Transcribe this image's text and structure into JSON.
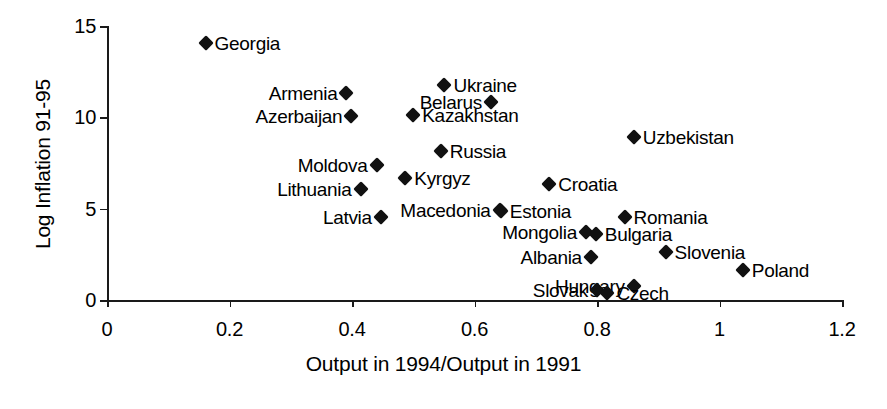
{
  "chart_data": {
    "type": "scatter",
    "title": "",
    "xlabel": "Output in 1994/Output in 1991",
    "ylabel": "Log Inflation 91-95",
    "xlim": [
      0,
      1.2
    ],
    "ylim": [
      0,
      15
    ],
    "xticks": [
      "0",
      "0.2",
      "0.4",
      "0.6",
      "0.8",
      "1",
      "1.2"
    ],
    "xtick_values": [
      0,
      0.2,
      0.4,
      0.6,
      0.8,
      1.0,
      1.2
    ],
    "yticks": [
      "0",
      "5",
      "10",
      "15"
    ],
    "ytick_values": [
      0,
      5,
      10,
      15
    ],
    "grid": false,
    "legend": "none",
    "marker": "filled-diamond",
    "marker_color": "#111111",
    "points": [
      {
        "label": "Georgia",
        "x": 0.161,
        "y": 14.05,
        "label_side": "right"
      },
      {
        "label": "Ukraine",
        "x": 0.551,
        "y": 11.75,
        "label_side": "right"
      },
      {
        "label": "Armenia",
        "x": 0.391,
        "y": 11.35,
        "label_side": "left"
      },
      {
        "label": "Belarus",
        "x": 0.627,
        "y": 10.85,
        "label_side": "left"
      },
      {
        "label": "Kazakhstan",
        "x": 0.5,
        "y": 10.15,
        "label_side": "right"
      },
      {
        "label": "Azerbaijan",
        "x": 0.399,
        "y": 10.1,
        "label_side": "left"
      },
      {
        "label": "Uzbekistan",
        "x": 0.86,
        "y": 8.95,
        "label_side": "right"
      },
      {
        "label": "Russia",
        "x": 0.545,
        "y": 8.15,
        "label_side": "right"
      },
      {
        "label": "Moldova",
        "x": 0.44,
        "y": 7.4,
        "label_side": "left"
      },
      {
        "label": "Kyrgyz",
        "x": 0.487,
        "y": 6.7,
        "label_side": "right"
      },
      {
        "label": "Croatia",
        "x": 0.722,
        "y": 6.35,
        "label_side": "right"
      },
      {
        "label": "Lithuania",
        "x": 0.414,
        "y": 6.1,
        "label_side": "left"
      },
      {
        "label": "Macedonia",
        "x": 0.641,
        "y": 4.95,
        "label_side": "left"
      },
      {
        "label": "Estonia",
        "x": 0.643,
        "y": 4.85,
        "label_side": "right"
      },
      {
        "label": "Romania",
        "x": 0.845,
        "y": 4.55,
        "label_side": "right"
      },
      {
        "label": "Latvia",
        "x": 0.447,
        "y": 4.55,
        "label_side": "left"
      },
      {
        "label": "Mongolia",
        "x": 0.782,
        "y": 3.75,
        "label_side": "left"
      },
      {
        "label": "Bulgaria",
        "x": 0.798,
        "y": 3.6,
        "label_side": "right"
      },
      {
        "label": "Slovenia",
        "x": 0.912,
        "y": 2.65,
        "label_side": "right"
      },
      {
        "label": "Albania",
        "x": 0.79,
        "y": 2.35,
        "label_side": "left"
      },
      {
        "label": "Poland",
        "x": 1.038,
        "y": 1.65,
        "label_side": "right"
      },
      {
        "label": "Hungary",
        "x": 0.86,
        "y": 0.75,
        "label_side": "left"
      },
      {
        "label": "Slovak",
        "x": 0.8,
        "y": 0.55,
        "label_side": "left"
      },
      {
        "label": "Czech",
        "x": 0.817,
        "y": 0.4,
        "label_side": "right"
      }
    ]
  }
}
